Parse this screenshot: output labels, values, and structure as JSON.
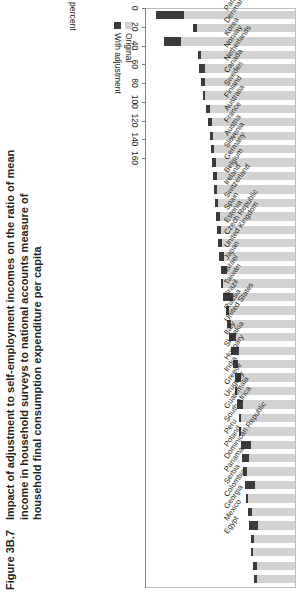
{
  "figure": {
    "number": "Figure 3B.7",
    "title": "Impact of adjustment to self-employment incomes on the ratio of mean income in household surveys to national accounts measure of household final consumption expenditure per capita"
  },
  "legend": {
    "items": [
      {
        "label": "Original",
        "color": "#d2d2d2"
      },
      {
        "label": "With adjustment",
        "color": "#3b3b3d"
      }
    ]
  },
  "axis": {
    "unit_label": "percent",
    "ticks": [
      "160",
      "140",
      "120",
      "100",
      "80",
      "60",
      "40",
      "20",
      "0"
    ]
  },
  "chart_data": {
    "type": "bar",
    "title": "Impact of adjustment to self-employment incomes on the ratio of mean income in household surveys to national accounts measure of household final consumption expenditure per capita",
    "xlabel": "percent",
    "ylabel": "",
    "xlim": [
      0,
      160
    ],
    "orientation": "horizontal",
    "reversed_axis": true,
    "grid": false,
    "legend_position": "bottom-left",
    "categories": [
      "Paraguay",
      "Denmark",
      "Korea",
      "Norway",
      "Netherlands",
      "Canada",
      "Sweden",
      "Finland",
      "Australia",
      "France",
      "Austria",
      "Slovenia",
      "Germany",
      "Belgium",
      "Ireland",
      "Switzerland",
      "Poland",
      "Estonia",
      "Czech Republic",
      "United Kingdom",
      "Japan",
      "Israel",
      "Taiwan",
      "Brazil",
      "Russia",
      "United States",
      "Italy",
      "Slovakia",
      "Hungary",
      "India",
      "Greece",
      "Uruguay",
      "Guatemala",
      "South Africa",
      "Peru",
      "Poland",
      "Dominican Republic",
      "Panama",
      "Serbia",
      "Colombia",
      "Georgia",
      "Mexico",
      "Egypt"
    ],
    "series": [
      {
        "name": "Original",
        "color": "#d2d2d2",
        "values": [
          148,
          109,
          140,
          103,
          102,
          101,
          99,
          97,
          95,
          93,
          92,
          90,
          88,
          87,
          86,
          84,
          83,
          81,
          80,
          78,
          77,
          75,
          74,
          72,
          70,
          68,
          66,
          64,
          63,
          61,
          59,
          57,
          56,
          54,
          52,
          51,
          49,
          48,
          46,
          45,
          43,
          42,
          40
        ]
      },
      {
        "name": "With adjustment",
        "color": "#3b3b3d",
        "values": [
          148,
          109,
          140,
          103,
          102,
          101,
          99,
          97,
          95,
          93,
          92,
          90,
          88,
          87,
          86,
          84,
          83,
          81,
          80,
          78,
          77,
          75,
          74,
          72,
          70,
          68,
          66,
          64,
          63,
          61,
          59,
          57,
          56,
          54,
          52,
          51,
          49,
          48,
          46,
          45,
          43,
          42,
          40
        ]
      }
    ],
    "bars": [
      {
        "category": "Paraguay",
        "original": 148,
        "with_adjustment": 118
      },
      {
        "category": "Denmark",
        "original": 109,
        "with_adjustment": 104
      },
      {
        "category": "Korea",
        "original": 140,
        "with_adjustment": 122
      },
      {
        "category": "Norway",
        "original": 103,
        "with_adjustment": 100
      },
      {
        "category": "Netherlands",
        "original": 102,
        "with_adjustment": 96
      },
      {
        "category": "Canada",
        "original": 100,
        "with_adjustment": 96
      },
      {
        "category": "Sweden",
        "original": 97,
        "with_adjustment": 96
      },
      {
        "category": "Finland",
        "original": 95,
        "with_adjustment": 91
      },
      {
        "category": "Australia",
        "original": 93,
        "with_adjustment": 89
      },
      {
        "category": "France",
        "original": 91,
        "with_adjustment": 87
      },
      {
        "category": "Austria",
        "original": 90,
        "with_adjustment": 86
      },
      {
        "category": "Slovenia",
        "original": 88,
        "with_adjustment": 84
      },
      {
        "category": "Germany",
        "original": 87,
        "with_adjustment": 83
      },
      {
        "category": "Belgium",
        "original": 86,
        "with_adjustment": 83
      },
      {
        "category": "Ireland",
        "original": 85,
        "with_adjustment": 82
      },
      {
        "category": "Switzerland",
        "original": 84,
        "with_adjustment": 80
      },
      {
        "category": "Spain",
        "original": 83,
        "with_adjustment": 79
      },
      {
        "category": "Estonia",
        "original": 82,
        "with_adjustment": 78
      },
      {
        "category": "Czech Republic",
        "original": 81,
        "with_adjustment": 76
      },
      {
        "category": "United Kingdom",
        "original": 79,
        "with_adjustment": 73
      },
      {
        "category": "Japan",
        "original": 78,
        "with_adjustment": 77
      },
      {
        "category": "Israel",
        "original": 77,
        "with_adjustment": 66
      },
      {
        "category": "Taiwan",
        "original": 74,
        "with_adjustment": 70
      },
      {
        "category": "Brazil",
        "original": 72,
        "with_adjustment": 68
      },
      {
        "category": "Russia",
        "original": 70,
        "with_adjustment": 63
      },
      {
        "category": "United States",
        "original": 68,
        "with_adjustment": 60
      },
      {
        "category": "Italy",
        "original": 66,
        "with_adjustment": 61
      },
      {
        "category": "Slovakia",
        "original": 64,
        "with_adjustment": 58
      },
      {
        "category": "Hungary",
        "original": 63,
        "with_adjustment": 62
      },
      {
        "category": "India",
        "original": 62,
        "with_adjustment": 55
      },
      {
        "category": "Greece",
        "original": 60,
        "with_adjustment": 58
      },
      {
        "category": "Uruguay",
        "original": 59,
        "with_adjustment": 58
      },
      {
        "category": "Guatemala",
        "original": 58,
        "with_adjustment": 47
      },
      {
        "category": "South Africa",
        "original": 56,
        "with_adjustment": 49
      },
      {
        "category": "Peru",
        "original": 55,
        "with_adjustment": 51
      },
      {
        "category": "Poland",
        "original": 53,
        "with_adjustment": 43
      },
      {
        "category": "Dominican Republic",
        "original": 52,
        "with_adjustment": 50
      },
      {
        "category": "Panama",
        "original": 50,
        "with_adjustment": 46
      },
      {
        "category": "Serbia",
        "original": 49,
        "with_adjustment": 39
      },
      {
        "category": "Colombia",
        "original": 47,
        "with_adjustment": 44
      },
      {
        "category": "Georgia",
        "original": 46,
        "with_adjustment": 45
      },
      {
        "category": "Mexico",
        "original": 45,
        "with_adjustment": 40
      },
      {
        "category": "Egypt",
        "original": 44,
        "with_adjustment": 40
      }
    ]
  }
}
